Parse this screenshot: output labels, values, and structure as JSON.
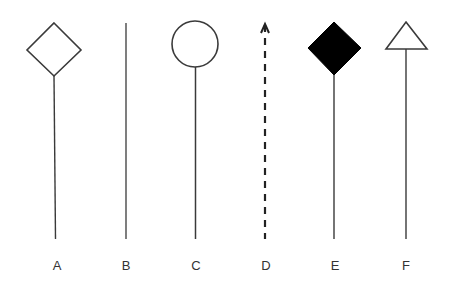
{
  "diagram": {
    "stroke_color": "#3a3a3a",
    "fill_color": "#000000",
    "items": [
      {
        "id": "A",
        "label": "A",
        "head": "hollow-diamond",
        "line": "solid"
      },
      {
        "id": "B",
        "label": "B",
        "head": "none",
        "line": "solid"
      },
      {
        "id": "C",
        "label": "C",
        "head": "hollow-circle",
        "line": "solid"
      },
      {
        "id": "D",
        "label": "D",
        "head": "open-arrow",
        "line": "dashed"
      },
      {
        "id": "E",
        "label": "E",
        "head": "filled-diamond",
        "line": "solid"
      },
      {
        "id": "F",
        "label": "F",
        "head": "hollow-triangle",
        "line": "solid"
      }
    ]
  }
}
